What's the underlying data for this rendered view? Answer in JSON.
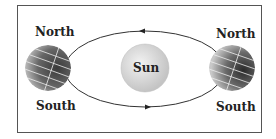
{
  "diagram": {
    "sun": {
      "label": "Sun"
    },
    "earth_left": {
      "north_label": "North",
      "south_label": "South"
    },
    "earth_right": {
      "north_label": "North",
      "south_label": "South"
    },
    "orbit": {
      "direction": "counterclockwise"
    },
    "colors": {
      "sun_fill": "#d8d8d8",
      "earth_dark": "#333333",
      "frame": "#555555"
    }
  }
}
